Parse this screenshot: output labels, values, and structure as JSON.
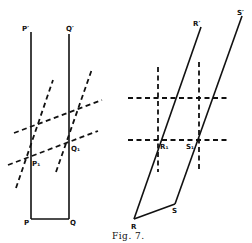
{
  "figure": {
    "caption": "Fig. 7.",
    "left_diagram": {
      "labels": {
        "p_prime": "P′",
        "q_prime": "Q′",
        "p1": "P₁",
        "q1": "Q₁",
        "p": "P",
        "q": "Q"
      }
    },
    "right_diagram": {
      "labels": {
        "r_prime": "R′",
        "s_prime": "S′",
        "r1": "R₁",
        "s1": "S₁",
        "r": "R",
        "s": "S"
      }
    }
  }
}
